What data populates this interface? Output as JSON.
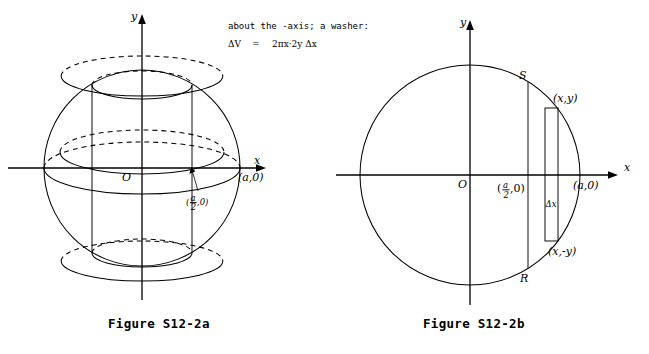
{
  "page": {
    "width": 649,
    "height": 354,
    "background": "#ffffff",
    "ink": "#000000"
  },
  "note": {
    "line1": "about the  -axis; a washer:",
    "line2_lhs": "ΔV",
    "line2_eq": "=",
    "line2_rhs": "2πx·2y Δx"
  },
  "figures": [
    {
      "id": "figure-a",
      "caption": "Figure S12-2a",
      "type": "sphere-with-inscribed-cylinder",
      "axes": {
        "x_label": "x",
        "y_label": "y",
        "origin_label": "O"
      },
      "labels": {
        "point_a": "(a,0)",
        "point_half_a_num": "a",
        "point_half_a_den": "2",
        "point_half_a_tail": ",0)",
        "point_half_a_open": "("
      },
      "geometry": {
        "center_x": 142,
        "center_y": 168,
        "radius": 98,
        "cylinder_half_width": 50,
        "cylinder_top_y": 85,
        "cylinder_bottom_y": 253,
        "ellipse_ry": 14
      }
    },
    {
      "id": "figure-b",
      "caption": "Figure S12-2b",
      "type": "circle-with-vertical-strip",
      "axes": {
        "x_label": "x",
        "y_label": "y",
        "origin_label": "O"
      },
      "labels": {
        "chord_top": "S",
        "chord_bottom": "R",
        "strip_top_point": "(x,y)",
        "strip_bottom_point": "(x,-y)",
        "strip_width": "Δx",
        "point_a": "(a,0)",
        "point_half_a_num": "a",
        "point_half_a_den": "2",
        "point_half_a_tail": ",0)",
        "point_half_a_open": "("
      },
      "geometry": {
        "center_x": 470,
        "center_y": 175,
        "radius": 110,
        "chord_x": 528,
        "strip_left_x": 545,
        "strip_right_x": 558,
        "strip_top_y": 108,
        "strip_bottom_y": 241
      }
    }
  ]
}
